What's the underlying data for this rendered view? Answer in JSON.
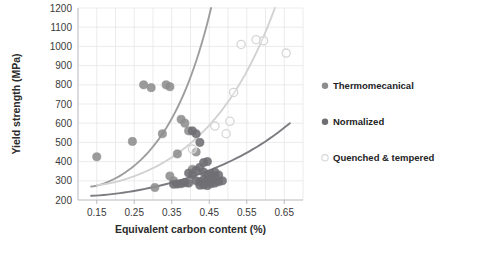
{
  "chart_data": {
    "type": "scatter",
    "title": "",
    "xlabel": "Equivalent carbon content (%)",
    "ylabel": "Yield strength (MPa)",
    "xlim": [
      0.1,
      0.7
    ],
    "ylim": [
      200,
      1200
    ],
    "xticks": [
      "0.15",
      "0.25",
      "0.35",
      "0.45",
      "0.55",
      "0.65"
    ],
    "xtick_values": [
      0.15,
      0.25,
      0.35,
      0.45,
      0.55,
      0.65
    ],
    "yticks": [
      "200",
      "300",
      "400",
      "500",
      "600",
      "700",
      "800",
      "900",
      "1000",
      "1100",
      "1200"
    ],
    "ytick_values": [
      200,
      300,
      400,
      500,
      600,
      700,
      800,
      900,
      1000,
      1100,
      1200
    ],
    "grid": true,
    "legend_position": "right",
    "series": [
      {
        "name": "Thermomecanical",
        "marker": "filled-circle",
        "color": "#8d8d8d",
        "points": [
          [
            0.15,
            425
          ],
          [
            0.245,
            505
          ],
          [
            0.275,
            800
          ],
          [
            0.295,
            785
          ],
          [
            0.335,
            800
          ],
          [
            0.345,
            790
          ],
          [
            0.325,
            545
          ],
          [
            0.345,
            325
          ],
          [
            0.305,
            265
          ],
          [
            0.375,
            620
          ],
          [
            0.385,
            600
          ],
          [
            0.395,
            560
          ],
          [
            0.365,
            440
          ],
          [
            0.415,
            450
          ],
          [
            0.405,
            360
          ],
          [
            0.355,
            300
          ]
        ],
        "trend": {
          "shape": "exponential",
          "color": "#9e9e9e",
          "from": [
            0.135,
            270
          ],
          "to": [
            0.455,
            1200
          ]
        }
      },
      {
        "name": "Normalized",
        "marker": "filled-circle",
        "color": "#6e6e73",
        "points": [
          [
            0.405,
            560
          ],
          [
            0.415,
            545
          ],
          [
            0.425,
            500
          ],
          [
            0.395,
            340
          ],
          [
            0.405,
            330
          ],
          [
            0.415,
            355
          ],
          [
            0.425,
            370
          ],
          [
            0.435,
            345
          ],
          [
            0.445,
            330
          ],
          [
            0.415,
            300
          ],
          [
            0.425,
            295
          ],
          [
            0.435,
            305
          ],
          [
            0.445,
            300
          ],
          [
            0.455,
            310
          ],
          [
            0.465,
            320
          ],
          [
            0.385,
            290
          ],
          [
            0.395,
            288
          ],
          [
            0.375,
            285
          ],
          [
            0.365,
            283
          ],
          [
            0.355,
            282
          ],
          [
            0.455,
            285
          ],
          [
            0.465,
            288
          ],
          [
            0.475,
            295
          ],
          [
            0.485,
            300
          ],
          [
            0.445,
            275
          ],
          [
            0.435,
            278
          ],
          [
            0.425,
            277
          ],
          [
            0.455,
            335
          ],
          [
            0.465,
            345
          ],
          [
            0.475,
            330
          ],
          [
            0.435,
            395
          ],
          [
            0.445,
            400
          ]
        ],
        "trend": {
          "shape": "exponential",
          "color": "#7b7b80",
          "from": [
            0.135,
            222
          ],
          "to": [
            0.665,
            600
          ]
        }
      },
      {
        "name": "Quenched & tempered",
        "marker": "open-circle",
        "color": "#d6d6d6",
        "points": [
          [
            0.405,
            465
          ],
          [
            0.465,
            585
          ],
          [
            0.505,
            610
          ],
          [
            0.515,
            760
          ],
          [
            0.535,
            1010
          ],
          [
            0.575,
            1035
          ],
          [
            0.595,
            1030
          ],
          [
            0.655,
            965
          ],
          [
            0.495,
            545
          ]
        ],
        "trend": {
          "shape": "exponential",
          "color": "#d2d2d2",
          "from": [
            0.15,
            278
          ],
          "to": [
            0.625,
            1200
          ]
        }
      }
    ]
  },
  "legend": {
    "items": [
      {
        "label": "Thermomecanical",
        "color": "#8d8d8d",
        "marker": "filled-circle"
      },
      {
        "label": "Normalized",
        "color": "#6e6e73",
        "marker": "filled-circle"
      },
      {
        "label": "Quenched & tempered",
        "color": "#d6d6d6",
        "marker": "open-circle"
      }
    ]
  }
}
